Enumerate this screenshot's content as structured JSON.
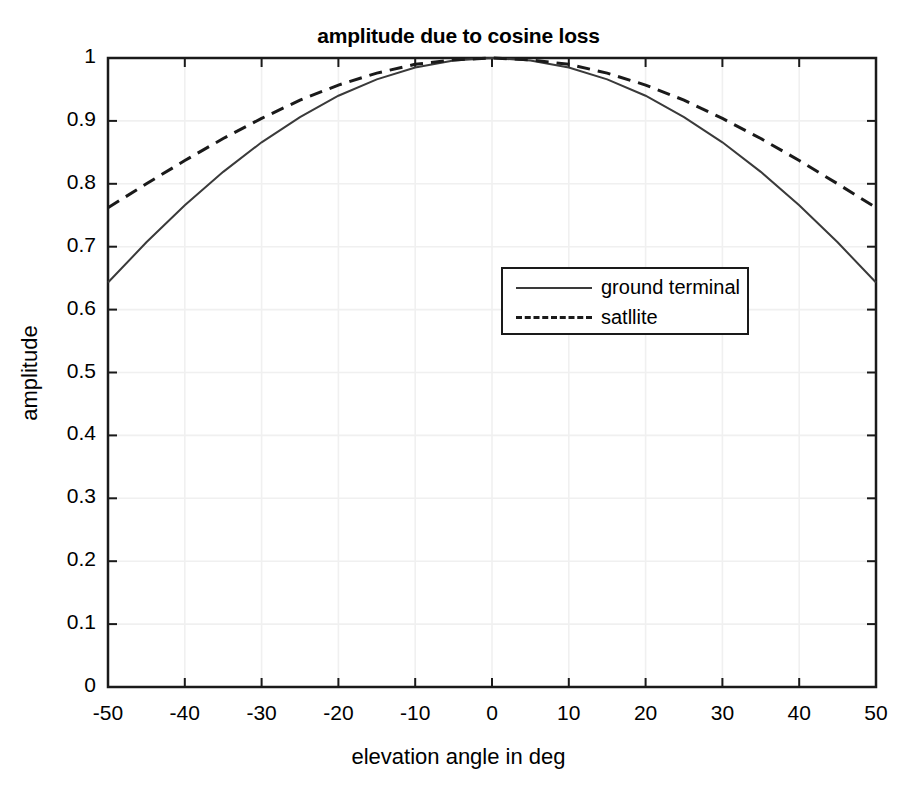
{
  "chart_data": {
    "type": "line",
    "title": "amplitude due to cosine loss",
    "xlabel": "elevation angle in deg",
    "ylabel": "amplitude",
    "xlim": [
      -50,
      50
    ],
    "ylim": [
      0,
      1
    ],
    "grid": true,
    "legend_position": "center-right",
    "x_ticks": [
      "-50",
      "-40",
      "-30",
      "-20",
      "-10",
      "0",
      "10",
      "20",
      "30",
      "40",
      "50"
    ],
    "y_ticks": [
      "0",
      "0.1",
      "0.2",
      "0.3",
      "0.4",
      "0.5",
      "0.6",
      "0.7",
      "0.8",
      "0.9",
      "1"
    ],
    "x": [
      -50,
      -45,
      -40,
      -35,
      -30,
      -25,
      -20,
      -15,
      -10,
      -5,
      0,
      5,
      10,
      15,
      20,
      25,
      30,
      35,
      40,
      45,
      50
    ],
    "series": [
      {
        "name": "ground terminal",
        "style": "solid",
        "color": "#3a3a3a",
        "values": [
          0.643,
          0.707,
          0.766,
          0.819,
          0.866,
          0.906,
          0.94,
          0.966,
          0.985,
          0.996,
          1.0,
          0.996,
          0.985,
          0.966,
          0.94,
          0.906,
          0.866,
          0.819,
          0.766,
          0.707,
          0.643
        ]
      },
      {
        "name": "satllite",
        "style": "dashed",
        "color": "#1a1a1a",
        "values": [
          0.762,
          0.8,
          0.837,
          0.872,
          0.904,
          0.933,
          0.957,
          0.976,
          0.99,
          0.997,
          1.0,
          0.997,
          0.99,
          0.976,
          0.957,
          0.933,
          0.904,
          0.872,
          0.837,
          0.8,
          0.762
        ]
      }
    ]
  },
  "legend": {
    "entries": [
      {
        "label": "ground terminal"
      },
      {
        "label": "satllite"
      }
    ]
  },
  "colors": {
    "axis": "#1a1a1a",
    "grid": "#f0f0f0",
    "background": "#ffffff",
    "text": "#000000"
  }
}
